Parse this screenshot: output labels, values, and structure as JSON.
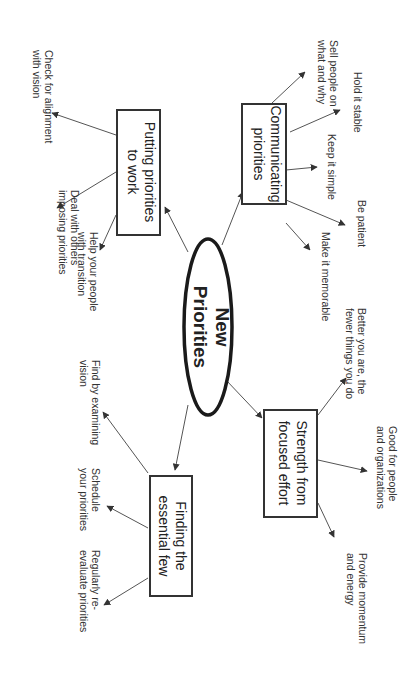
{
  "diagram": {
    "type": "mind-map",
    "orientation": "rotated-90-clockwise",
    "root": {
      "line1": "New",
      "line2": "Priorities"
    },
    "branches": [
      {
        "id": "communicating",
        "line1": "Communicating",
        "line2": "priorities",
        "children": [
          {
            "line1": "Sell people on",
            "line2": "what and why"
          },
          {
            "line1": "Hold it stable",
            "line2": ""
          },
          {
            "line1": "Keep it simple",
            "line2": ""
          },
          {
            "line1": "Be patient",
            "line2": ""
          },
          {
            "line1": "Make it memorable",
            "line2": ""
          }
        ]
      },
      {
        "id": "putting",
        "line1": "Putting priorities",
        "line2": "to work",
        "children": [
          {
            "line1": "Check for alignment",
            "line2": "with vision"
          },
          {
            "line1": "Deal with others",
            "line2": "imposing priorities"
          },
          {
            "line1": "Help your people",
            "line2": "with transition"
          }
        ]
      },
      {
        "id": "strength",
        "line1": "Strength from",
        "line2": "focused effort",
        "children": [
          {
            "line1": "Better you are, the",
            "line2": "fewer things you do"
          },
          {
            "line1": "Good for people",
            "line2": "and organizations"
          },
          {
            "line1": "Provide momentum",
            "line2": "and energy"
          }
        ]
      },
      {
        "id": "finding",
        "line1": "Finding the",
        "line2": "essential few",
        "children": [
          {
            "line1": "Find by examining",
            "line2": "vision"
          },
          {
            "line1": "Schedule",
            "line2": "your priorities"
          },
          {
            "line1": "Regularly re-",
            "line2": "evaluate priorities"
          }
        ]
      }
    ],
    "colors": {
      "background": "#ffffff",
      "box_stroke": "#333333",
      "ellipse_stroke": "#1a1a1a",
      "edge": "#555555",
      "text": "#333333"
    }
  }
}
